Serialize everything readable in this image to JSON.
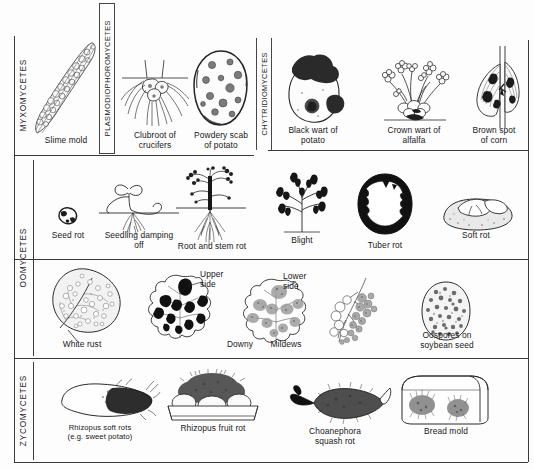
{
  "figure": {
    "title_alt": "Fungal disease symptom chart by class",
    "ink_color": "#17171a",
    "rule_color": "#3a3a3a"
  },
  "classes": [
    {
      "id": "myxomycetes",
      "label": "MYXOMYCETES"
    },
    {
      "id": "plasmodiophoromycetes",
      "label": "PLASMODIOPHOROMYCETES"
    },
    {
      "id": "chytridiomycetes",
      "label": "CHYTRIDIOMYCETES"
    },
    {
      "id": "oomycetes",
      "label": "OOMYCETES"
    },
    {
      "id": "zycomycetes",
      "label": "ZYCOMYCETES"
    }
  ],
  "rows": [
    {
      "id": "row-1",
      "items": [
        {
          "id": "slime-mold",
          "caption": "Slime mold"
        },
        {
          "id": "clubroot",
          "caption": "Clubroot  of\ncrucifers"
        },
        {
          "id": "powdery-scab",
          "caption": "Powdery scab\nof  potato"
        },
        {
          "id": "black-wart",
          "caption": "Black wart of\npotato"
        },
        {
          "id": "crown-wart",
          "caption": "Crown wart of\nalfalfa"
        },
        {
          "id": "brown-spot",
          "caption": "Brown spot\nof  corn"
        }
      ]
    },
    {
      "id": "row-2",
      "items": [
        {
          "id": "seed-rot",
          "caption": "Seed rot"
        },
        {
          "id": "seedling-damping",
          "caption": "Seedling damping\noff"
        },
        {
          "id": "root-stem-rot",
          "caption": "Root and stem rot"
        },
        {
          "id": "blight",
          "caption": "Blight"
        },
        {
          "id": "tuber-rot",
          "caption": "Tuber rot"
        },
        {
          "id": "soft-rot",
          "caption": "Soft rot"
        }
      ]
    },
    {
      "id": "row-3",
      "items": [
        {
          "id": "white-rust",
          "caption": "White rust"
        },
        {
          "id": "downy-upper",
          "caption": "Upper\nside"
        },
        {
          "id": "downy-lower",
          "caption": "Lower\nside"
        },
        {
          "id": "downy-word",
          "caption": "Downy"
        },
        {
          "id": "mildews-word",
          "caption": "Mildews"
        },
        {
          "id": "oospores",
          "caption": "Oospores on\nsoybean seed"
        }
      ]
    },
    {
      "id": "row-4",
      "items": [
        {
          "id": "rhizopus-soft-rot",
          "caption": "Rhizopus soft rots\n(e.g. sweet potato)"
        },
        {
          "id": "rhizopus-fruit",
          "caption": "Rhizopus fruit rot"
        },
        {
          "id": "choanephora",
          "caption": "Choanephora\nsquash  rot"
        },
        {
          "id": "bread-mold",
          "caption": "Bread mold"
        }
      ]
    }
  ]
}
